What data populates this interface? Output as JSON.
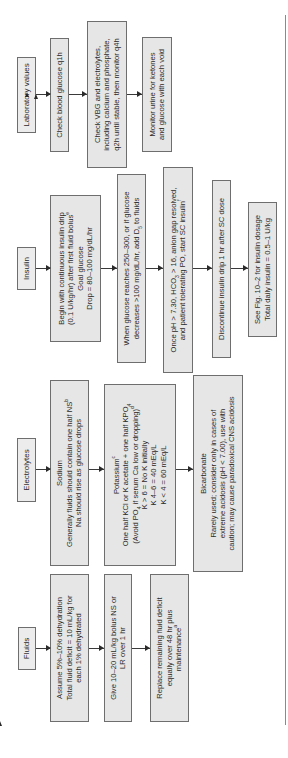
{
  "rows": {
    "lab": {
      "header": "Laboratory values",
      "steps": [
        {
          "lines": [
            "Check blood glucose q1h"
          ]
        },
        {
          "lines": [
            "Check VBG and electrolytes,",
            "including calcium and phosphate,",
            "q2h until stable, then monitor q4h"
          ]
        },
        {
          "lines": [
            "Monitor urine for ketones",
            "and glucose with each void"
          ]
        }
      ]
    },
    "insulin": {
      "header": "Insulin",
      "steps": [
        {
          "lines": [
            "Begin with continuous insulin drip",
            "(0.1 U/kg/hr) after first fluid bolus",
            "Goal glucose",
            "Drop = 80–100 mg/dL/hr"
          ],
          "sup": "e"
        },
        {
          "lines": [
            "When glucose reaches 250–300, or if glucose",
            "decreases >100 mg/dL/hr, add D",
            " to fluids"
          ],
          "sub": "5"
        },
        {
          "lines": [
            "Once pH > 7.30, HCO",
            " > 16, anion gap resolved,",
            "and patient tolerating PO, start SC insulin"
          ],
          "sub": "3",
          "sup": "f"
        },
        {
          "lines": [
            "Discontinue insulin drip 1 hr after SC dose"
          ]
        },
        {
          "lines": [
            "See Fig. 10–2 for insulin dosage",
            "Total daily insulin = 0.5–1 U/kg"
          ]
        }
      ]
    },
    "electrolytes": {
      "header": "Electrolytes",
      "steps": [
        {
          "title": "Sodium",
          "lines": [
            "Generally fluids should contain one half NS",
            "Na should rise as glucose drops"
          ],
          "sup": "b"
        },
        {
          "title": "Potassium",
          "title_sup": "c",
          "lines": [
            "One half KCl or K acetate + one half KPO",
            "(Avoid PO",
            " if serum Ca low or dropping)",
            "K > 6 = No K initially",
            "K 4–6 = 40 mEq/L",
            "K < 4 = 60 mEq/L"
          ],
          "sub": "4",
          "sup": "d"
        },
        {
          "title": "Bicarbonate",
          "lines": [
            "Rarely used; consider only in cases of",
            "extreme acidosis (pH < 7.00), use with",
            "caution; may cause paradoxical CNS acidosis"
          ]
        }
      ]
    },
    "fluids": {
      "header": "Fluids",
      "steps": [
        {
          "lines": [
            "Assume 5%–10% dehydration",
            "Total fluid deficit = 10 mL/kg for",
            "each 1% dehydrated"
          ]
        },
        {
          "lines": [
            "Give 10–20 mL/kg bolus NS or",
            "LR over 1 hr"
          ]
        },
        {
          "lines": [
            "Replace remaining fluid deficit",
            "equally over 48 hr plus",
            "maintenance"
          ],
          "sup": "a"
        }
      ]
    }
  },
  "colors": {
    "box_fill": "#e6e6e6",
    "box_border": "#6e6e6e",
    "arrow": "#2a2a2a",
    "text": "#2a2a2a"
  }
}
